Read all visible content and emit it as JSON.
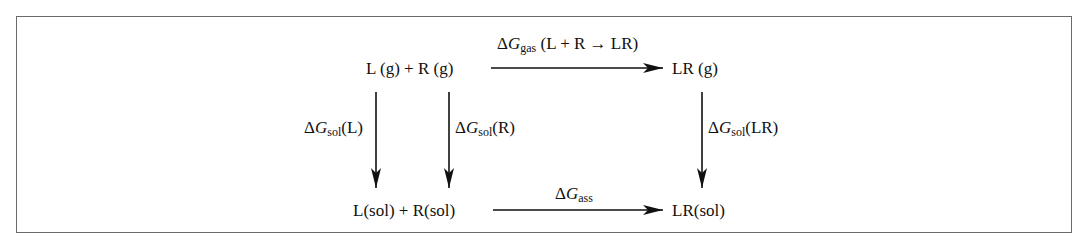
{
  "diagram": {
    "type": "thermodynamic-cycle",
    "nodes": {
      "top_left": "L (g) + R (g)",
      "top_right": "LR (g)",
      "bottom_left": "L(sol) + R(sol)",
      "bottom_right": "LR(sol)"
    },
    "labels": {
      "gas": {
        "delta": "Δ",
        "symbol": "G",
        "sub": "gas",
        "suffix": " (L + R → LR)"
      },
      "sol_L": {
        "delta": "Δ",
        "symbol": "G",
        "sub": "sol",
        "suffix": "(L)"
      },
      "sol_R": {
        "delta": "Δ",
        "symbol": "G",
        "sub": "sol",
        "suffix": "(R)"
      },
      "sol_LR": {
        "delta": "Δ",
        "symbol": "G",
        "sub": "sol",
        "suffix": "(LR)"
      },
      "ass": {
        "delta": "Δ",
        "symbol": "G",
        "sub": "ass",
        "suffix": ""
      }
    },
    "edges": [
      {
        "from": "top_left",
        "to": "top_right",
        "label": "gas",
        "direction": "right"
      },
      {
        "from": "top_left",
        "to": "bottom_left",
        "label": "sol_L",
        "direction": "down",
        "species": "L"
      },
      {
        "from": "top_left",
        "to": "bottom_left",
        "label": "sol_R",
        "direction": "down",
        "species": "R"
      },
      {
        "from": "top_right",
        "to": "bottom_right",
        "label": "sol_LR",
        "direction": "down"
      },
      {
        "from": "bottom_left",
        "to": "bottom_right",
        "label": "ass",
        "direction": "right"
      }
    ],
    "colors": {
      "ink": "#111111",
      "frame": "#6a6a6a",
      "background": "#ffffff"
    }
  }
}
